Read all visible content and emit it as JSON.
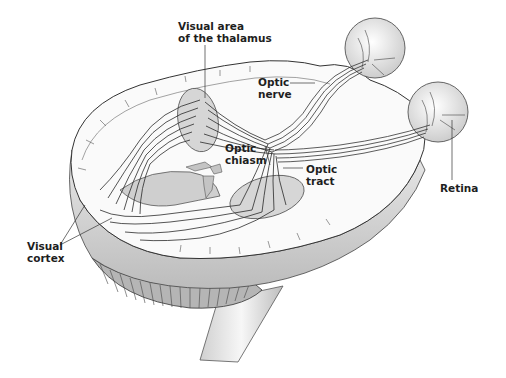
{
  "figure": {
    "labels": {
      "thalamus": {
        "line1": "Visual area",
        "line2": "of the thalamus"
      },
      "optic_nerve": {
        "line1": "Optic",
        "line2": "nerve"
      },
      "optic_chiasm": {
        "line1": "Optic",
        "line2": "chiasm"
      },
      "optic_tract": {
        "line1": "Optic",
        "line2": "tract"
      },
      "retina": {
        "line1": "Retina"
      },
      "visual_cortex": {
        "line1": "Visual",
        "line2": "cortex"
      }
    },
    "colors": {
      "line": "#2a2a2a",
      "brain_fill": "#f2f2f2",
      "shade": "#c8c8c8",
      "dark_shade": "#8a8a8a",
      "text": "#1e1e1e"
    }
  }
}
